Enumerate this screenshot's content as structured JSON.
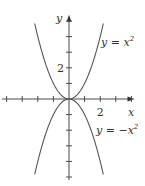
{
  "chart_data": {
    "type": "line",
    "title": "",
    "xlabel": "x",
    "ylabel": "y",
    "xlim": [
      -4.3,
      4.2
    ],
    "ylim": [
      -5.2,
      5.4
    ],
    "x_tick_step": 1,
    "y_tick_step": 1,
    "x_tick_labels": [
      {
        "value": 2,
        "text": "2"
      }
    ],
    "y_tick_labels": [
      {
        "value": 2,
        "text": "2"
      }
    ],
    "grid": false,
    "series": [
      {
        "name": "y = x²",
        "label_main": "y = x",
        "label_sup": "2",
        "formula": "x^2",
        "x": [
          -2.2,
          -2,
          -1.5,
          -1,
          -0.5,
          0,
          0.5,
          1,
          1.5,
          2,
          2.2
        ],
        "y": [
          4.84,
          4,
          2.25,
          1,
          0.25,
          0,
          0.25,
          1,
          2.25,
          4,
          4.84
        ]
      },
      {
        "name": "y = −x²",
        "label_main": "y = −x",
        "label_sup": "2",
        "formula": "-x^2",
        "x": [
          -2.2,
          -2,
          -1.5,
          -1,
          -0.5,
          0,
          0.5,
          1,
          1.5,
          2,
          2.2
        ],
        "y": [
          -4.84,
          -4,
          -2.25,
          -1,
          -0.25,
          0,
          -0.25,
          -1,
          -2.25,
          -4,
          -4.84
        ]
      }
    ]
  }
}
